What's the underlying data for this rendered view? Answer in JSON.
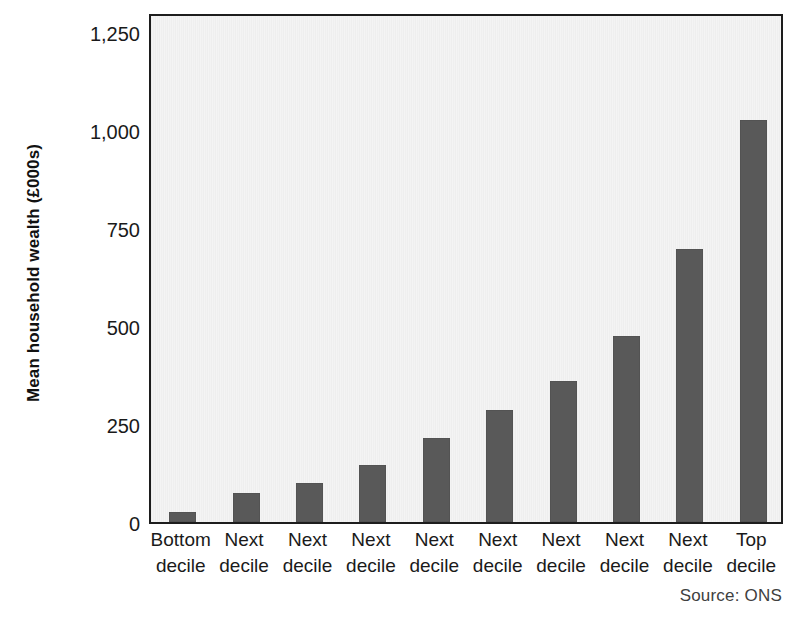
{
  "chart_data": {
    "type": "bar",
    "title": "",
    "xlabel": "",
    "ylabel": "Mean household wealth (£000s)",
    "categories": [
      "Bottom decile",
      "Next decile",
      "Next decile",
      "Next decile",
      "Next decile",
      "Next decile",
      "Next decile",
      "Next decile",
      "Next decile",
      "Top decile"
    ],
    "category_lines": [
      [
        "Bottom",
        "decile"
      ],
      [
        "Next",
        "decile"
      ],
      [
        "Next",
        "decile"
      ],
      [
        "Next",
        "decile"
      ],
      [
        "Next",
        "decile"
      ],
      [
        "Next",
        "decile"
      ],
      [
        "Next",
        "decile"
      ],
      [
        "Next",
        "decile"
      ],
      [
        "Next",
        "decile"
      ],
      [
        "Top",
        "decile"
      ]
    ],
    "values": [
      25,
      75,
      100,
      145,
      215,
      285,
      360,
      475,
      695,
      1025
    ],
    "ylim": [
      0,
      1300
    ],
    "yticks": [
      0,
      250,
      500,
      750,
      1000,
      1250
    ],
    "ytick_labels": [
      "0",
      "250",
      "500",
      "750",
      "1,000",
      "1,250"
    ],
    "grid": false,
    "legend": "none",
    "bar_color": "#595959",
    "plot_background_color": "#f1f1f1",
    "axis_color": "#1d1d1d"
  },
  "footer": {
    "source": "Source: ONS"
  }
}
